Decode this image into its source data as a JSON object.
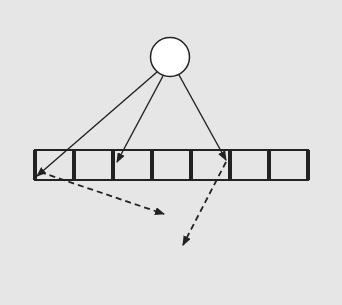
{
  "colors": {
    "background": "#e6e6e6",
    "stroke": "#222222",
    "node_fill": "#ffffff",
    "cell_fill": "#e6e6e6"
  },
  "root_node": {
    "cx": 170,
    "cy": 57,
    "r": 19.5
  },
  "array": {
    "x": 35,
    "y": 150,
    "cell_width": 39,
    "height": 30,
    "cell_count": 7,
    "thick_dividers": [
      0,
      2,
      5,
      7
    ]
  },
  "solid_arrows": [
    {
      "from": [
        157,
        72
      ],
      "to": [
        37,
        176
      ]
    },
    {
      "from": [
        163,
        76
      ],
      "to": [
        117,
        162
      ]
    },
    {
      "from": [
        179,
        75
      ],
      "to": [
        226,
        160
      ]
    }
  ],
  "dashed_arrows": [
    {
      "from": [
        40,
        172
      ],
      "to": [
        164,
        214
      ]
    },
    {
      "from": [
        226,
        162
      ],
      "to": [
        183,
        245
      ]
    }
  ]
}
